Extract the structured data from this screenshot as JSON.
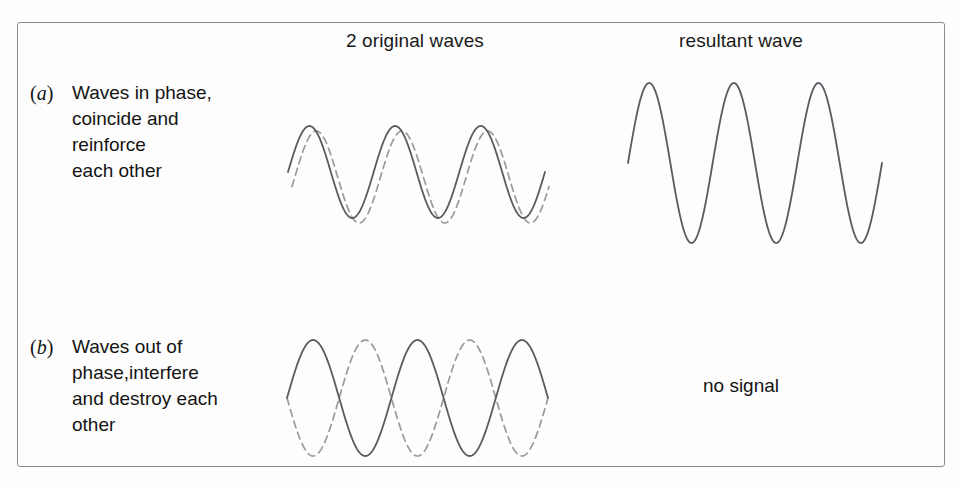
{
  "figure": {
    "title_columns": {
      "original": "2 original waves",
      "resultant": "resultant wave"
    },
    "rows": [
      {
        "tag_open": "(",
        "tag_letter": "a",
        "tag_close": ")",
        "lines": [
          "Waves in phase,",
          "coincide and",
          "reinforce",
          "each other"
        ],
        "resultant_label": ""
      },
      {
        "tag_open": "(",
        "tag_letter": "b",
        "tag_close": ")",
        "lines": [
          "Waves out of",
          "phase,interfere",
          "and destroy each",
          "other"
        ],
        "resultant_label": "no signal"
      }
    ],
    "colors": {
      "solid_wave": "#5a5a62",
      "dashed_wave": "#9a9a9a",
      "frame_border": "#8a8a8a",
      "text": "#141414",
      "background": "#fdfdfd"
    }
  },
  "chart_data": [
    {
      "type": "line",
      "name": "row-a-original-waves",
      "title": "2 original waves (in phase)",
      "xlabel": "",
      "ylabel": "",
      "grid": false,
      "legend": "none",
      "xlim": [
        0,
        3.25
      ],
      "ylim": [
        -1.15,
        1.15
      ],
      "series": [
        {
          "name": "wave-1-solid",
          "style": "solid",
          "color": "#5a5a62",
          "waveform": "sine",
          "amplitude": 1.0,
          "cycles": 3,
          "phase_deg": 0,
          "x_start_px": 288,
          "x_end_px": 545,
          "midline_px": 172,
          "amplitude_px": 46
        },
        {
          "name": "wave-2-dashed",
          "style": "dashed",
          "color": "#9a9a9a",
          "waveform": "sine",
          "amplitude": 1.0,
          "cycles": 3,
          "phase_deg": -12,
          "x_start_px": 292,
          "x_end_px": 549,
          "midline_px": 177,
          "amplitude_px": 46
        }
      ]
    },
    {
      "type": "line",
      "name": "row-a-resultant-wave",
      "title": "resultant wave (constructive interference)",
      "xlabel": "",
      "ylabel": "",
      "grid": false,
      "legend": "none",
      "xlim": [
        0,
        3.25
      ],
      "ylim": [
        -2.15,
        2.15
      ],
      "series": [
        {
          "name": "resultant-solid",
          "style": "solid",
          "color": "#5a5a62",
          "waveform": "sine",
          "amplitude": 2.0,
          "cycles": 3,
          "phase_deg": 0,
          "x_start_px": 628,
          "x_end_px": 882,
          "midline_px": 163,
          "amplitude_px": 80
        }
      ]
    },
    {
      "type": "line",
      "name": "row-b-original-waves",
      "title": "2 original waves (out of phase)",
      "xlabel": "",
      "ylabel": "",
      "grid": false,
      "legend": "none",
      "xlim": [
        0,
        3.25
      ],
      "ylim": [
        -1.15,
        1.15
      ],
      "series": [
        {
          "name": "wave-1-solid",
          "style": "solid",
          "color": "#5a5a62",
          "waveform": "sine",
          "amplitude": 1.0,
          "cycles": 2.5,
          "phase_deg": 0,
          "x_start_px": 287,
          "x_end_px": 548,
          "midline_px": 398,
          "amplitude_px": 58
        },
        {
          "name": "wave-2-dashed",
          "style": "dashed",
          "color": "#9a9a9a",
          "waveform": "sine",
          "amplitude": 1.0,
          "cycles": 2.5,
          "phase_deg": 180,
          "x_start_px": 287,
          "x_end_px": 548,
          "midline_px": 398,
          "amplitude_px": 58
        }
      ]
    },
    {
      "type": "table",
      "name": "row-b-resultant",
      "title": "resultant wave (destructive interference)",
      "annotation": "no signal"
    }
  ]
}
